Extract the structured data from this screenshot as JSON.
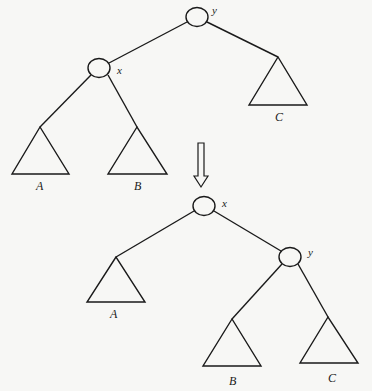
{
  "diagram": {
    "type": "binary-tree-rotation",
    "before": {
      "nodes": [
        {
          "id": "y",
          "label": "y",
          "role": "root"
        },
        {
          "id": "x",
          "label": "x",
          "role": "left-child-of-y"
        }
      ],
      "subtrees": [
        {
          "id": "A",
          "label": "A",
          "parent": "x",
          "side": "left"
        },
        {
          "id": "B",
          "label": "B",
          "parent": "x",
          "side": "right"
        },
        {
          "id": "C",
          "label": "C",
          "parent": "y",
          "side": "right"
        }
      ]
    },
    "transition": {
      "icon": "double-down-arrow-icon"
    },
    "after": {
      "nodes": [
        {
          "id": "x",
          "label": "x",
          "role": "root"
        },
        {
          "id": "y",
          "label": "y",
          "role": "right-child-of-x"
        }
      ],
      "subtrees": [
        {
          "id": "A",
          "label": "A",
          "parent": "x",
          "side": "left"
        },
        {
          "id": "B",
          "label": "B",
          "parent": "y",
          "side": "left"
        },
        {
          "id": "C",
          "label": "C",
          "parent": "y",
          "side": "right"
        }
      ]
    }
  }
}
